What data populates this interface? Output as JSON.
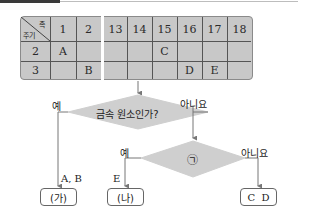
{
  "table": {
    "corner": {
      "top_label": "족",
      "bottom_label": "주기"
    },
    "group_headers": [
      "1",
      "2",
      "13",
      "14",
      "15",
      "16",
      "17",
      "18"
    ],
    "rows": [
      {
        "period": "2",
        "cells": [
          "A",
          "",
          "",
          "",
          "C",
          "",
          "",
          ""
        ]
      },
      {
        "period": "3",
        "cells": [
          "",
          "B",
          "",
          "",
          "",
          "D",
          "E",
          ""
        ]
      }
    ]
  },
  "flowchart": {
    "decision1": {
      "label": "금속 원소인가?",
      "yes_label": "예",
      "no_label": "아니요"
    },
    "decision2": {
      "label": "㉠",
      "yes_label": "예",
      "no_label": "아니요"
    },
    "branch_labels": {
      "ab": "A, B",
      "e": "E"
    },
    "outputs": {
      "ga": "(가)",
      "na": "(나)",
      "cd": "C  D"
    }
  },
  "colors": {
    "fill": "#c8c8c8",
    "line": "#777777"
  }
}
